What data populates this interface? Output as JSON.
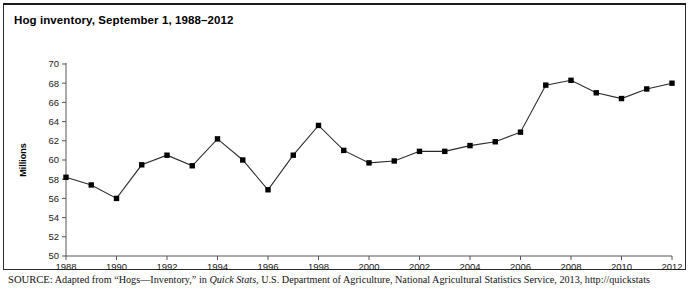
{
  "figure": {
    "title": "Hog inventory, September 1, 1988–2012",
    "source_kicker": "SOURCE:",
    "source_text_before_italic": " Adapted from “Hogs—Inventory,” in ",
    "source_italic": "Quick Stats",
    "source_text_after_italic": ", U.S. Department of Agriculture, National Agricultural Statistics Service, 2013, http://quickstats"
  },
  "chart_data": {
    "type": "line",
    "title": "Hog inventory, September 1, 1988–2012",
    "xlabel": "",
    "ylabel": "Millions",
    "x": [
      1988,
      1989,
      1990,
      1991,
      1992,
      1993,
      1994,
      1995,
      1996,
      1997,
      1998,
      1999,
      2000,
      2001,
      2002,
      2003,
      2004,
      2005,
      2006,
      2007,
      2008,
      2009,
      2010,
      2011,
      2012
    ],
    "values": [
      58.2,
      57.4,
      56.0,
      59.5,
      60.5,
      59.4,
      62.2,
      60.0,
      56.9,
      60.5,
      63.6,
      61.0,
      59.7,
      59.9,
      60.9,
      60.9,
      61.5,
      61.9,
      62.9,
      67.8,
      68.3,
      67.0,
      66.4,
      67.4,
      68.0
    ],
    "x_tick_labels": [
      "1988",
      "1990",
      "1992",
      "1994",
      "1996",
      "1998",
      "2000",
      "2002",
      "2004",
      "2006",
      "2008",
      "2010",
      "2012"
    ],
    "x_tick_values": [
      1988,
      1990,
      1992,
      1994,
      1996,
      1998,
      2000,
      2002,
      2004,
      2006,
      2008,
      2010,
      2012
    ],
    "y_tick_labels": [
      "50",
      "52",
      "54",
      "56",
      "58",
      "60",
      "62",
      "64",
      "66",
      "68",
      "70"
    ],
    "y_tick_values": [
      50,
      52,
      54,
      56,
      58,
      60,
      62,
      64,
      66,
      68,
      70
    ],
    "ylim": [
      50,
      70
    ],
    "xlim": [
      1988,
      2012
    ],
    "grid": false,
    "legend": false,
    "marker": "filled-square",
    "line_color": "#2b2b2b",
    "marker_color": "#000000",
    "axis_color": "#555555"
  },
  "layout": {
    "plot_left": 66,
    "plot_right": 672,
    "plot_top": 64,
    "plot_bottom": 256,
    "marker_size": 5.4,
    "tick_length": 4
  }
}
